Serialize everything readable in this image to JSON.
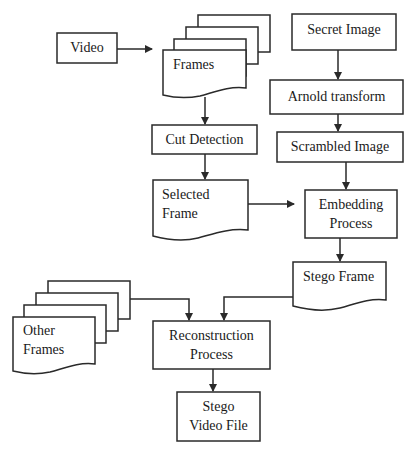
{
  "diagram": {
    "nodes": {
      "video": "Video",
      "frames": "Frames",
      "secret_image": "Secret Image",
      "arnold_transform": "Arnold transform",
      "cut_detection": "Cut Detection",
      "scrambled_image": "Scrambled Image",
      "selected_frame_1": "Selected",
      "selected_frame_2": "Frame",
      "embedding_1": "Embedding",
      "embedding_2": "Process",
      "stego_frame": "Stego Frame",
      "other_frames_1": "Other",
      "other_frames_2": "Frames",
      "reconstruction_1": "Reconstruction",
      "reconstruction_2": "Process",
      "stego_video_1": "Stego",
      "stego_video_2": "Video File"
    },
    "edges": [
      {
        "from": "Video",
        "to": "Frames"
      },
      {
        "from": "Frames",
        "to": "Cut Detection"
      },
      {
        "from": "Cut Detection",
        "to": "Selected Frame"
      },
      {
        "from": "Secret Image",
        "to": "Arnold transform"
      },
      {
        "from": "Arnold transform",
        "to": "Scrambled Image"
      },
      {
        "from": "Scrambled Image",
        "to": "Embedding Process"
      },
      {
        "from": "Selected Frame",
        "to": "Embedding Process"
      },
      {
        "from": "Embedding Process",
        "to": "Stego Frame"
      },
      {
        "from": "Other Frames",
        "to": "Reconstruction Process"
      },
      {
        "from": "Stego Frame",
        "to": "Reconstruction Process"
      },
      {
        "from": "Reconstruction Process",
        "to": "Stego Video File"
      }
    ],
    "colors": {
      "stroke": "#2a2a2a",
      "background": "#ffffff"
    }
  }
}
